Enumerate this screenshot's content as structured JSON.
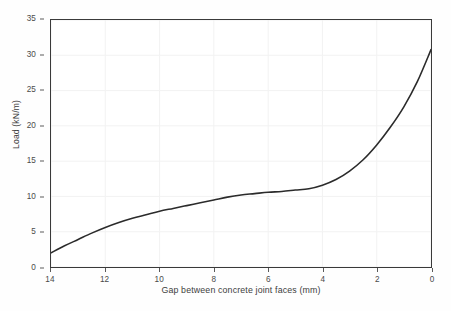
{
  "chart_data": {
    "type": "line",
    "title": "",
    "xlabel": "Gap between concrete joint faces (mm)",
    "ylabel": "Load (kN/m)",
    "xlim": [
      14,
      0
    ],
    "ylim": [
      0,
      35
    ],
    "x_reversed": true,
    "grid": true,
    "legend": null,
    "x_ticks": [
      14,
      12,
      10,
      8,
      6,
      4,
      2,
      0
    ],
    "y_ticks": [
      0,
      5,
      10,
      15,
      20,
      25,
      30,
      35
    ],
    "x_tick_labels": [
      "14",
      "12",
      "10",
      "8",
      "6",
      "4",
      "2",
      "0"
    ],
    "y_tick_labels": [
      "0",
      "5",
      "10",
      "15",
      "20",
      "25",
      "30",
      "35"
    ],
    "series": [
      {
        "name": "Load vs gap",
        "color": "#2b2b2b",
        "line_width": 1.6,
        "x": [
          14.0,
          13.5,
          13.0,
          12.5,
          12.0,
          11.5,
          11.0,
          10.5,
          10.0,
          9.5,
          9.0,
          8.5,
          8.0,
          7.5,
          7.0,
          6.5,
          6.0,
          5.5,
          5.0,
          4.5,
          4.0,
          3.5,
          3.0,
          2.5,
          2.0,
          1.5,
          1.0,
          0.5,
          0.0
        ],
        "y": [
          2.0,
          3.0,
          3.9,
          4.8,
          5.6,
          6.3,
          6.9,
          7.4,
          7.9,
          8.3,
          8.7,
          9.1,
          9.5,
          9.9,
          10.2,
          10.4,
          10.6,
          10.7,
          10.9,
          11.1,
          11.6,
          12.4,
          13.6,
          15.2,
          17.3,
          19.8,
          22.7,
          26.3,
          30.8
        ]
      }
    ]
  },
  "axes": {
    "y_axis_title": "Load (kN/m)",
    "x_axis_title": "Gap between concrete joint faces (mm)"
  },
  "style": {
    "background": "#ffffff",
    "frame_color": "#3a3a3a",
    "grid_color": "#f2f2f2",
    "tick_color": "#5a5a5a",
    "text_color": "#3d3d3d",
    "curve_color": "#2b2b2b"
  }
}
